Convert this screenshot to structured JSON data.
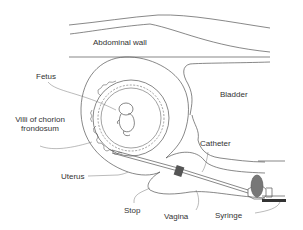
{
  "diagram": {
    "colors": {
      "line": "#555555",
      "leader": "#777777",
      "stop_fill": "#555555",
      "syringe_plunger": "#666666",
      "text": "#333333",
      "background": "#ffffff"
    },
    "labels": {
      "abdominal_wall": "Abdominal wall",
      "fetus": "Fetus",
      "bladder": "Bladder",
      "villi_line1": "Villi of chorion",
      "villi_line2": "frondosum",
      "catheter": "Catheter",
      "uterus": "Uterus",
      "stop": "Stop",
      "vagina": "Vagina",
      "syringe": "Syringe"
    }
  }
}
